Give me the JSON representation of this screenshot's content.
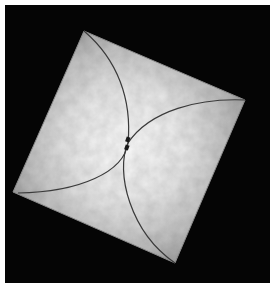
{
  "image": {
    "description": "Photograph of a rotated square of light textured paper on a black background, with two curved lines crossing at the center",
    "colors": {
      "background": "#050505",
      "paper_center": "#f4f4f4",
      "paper_edge": "#a8a8a8",
      "curve": "#3a3a3a",
      "border": "#ffffff"
    },
    "square_corners": {
      "top": [
        84,
        31
      ],
      "right": [
        245,
        100
      ],
      "bottom": [
        175,
        263
      ],
      "left": [
        13,
        192
      ]
    },
    "crossing_point": [
      128,
      143
    ]
  }
}
